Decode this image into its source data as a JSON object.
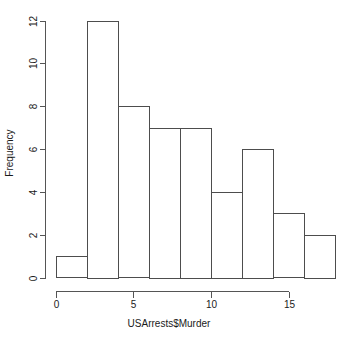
{
  "chart_data": {
    "type": "bar",
    "title": "",
    "subtitle": "",
    "xlabel": "USArrests$Murder",
    "ylabel": "Frequency",
    "categories": [
      "0-2",
      "2-4",
      "4-6",
      "6-8",
      "8-10",
      "10-12",
      "12-14",
      "14-16",
      "16-18"
    ],
    "bin_edges": [
      0,
      2,
      4,
      6,
      8,
      10,
      12,
      14,
      16,
      18
    ],
    "bin_width": 2,
    "values": [
      1,
      12,
      8,
      7,
      7,
      4,
      6,
      3,
      2
    ],
    "xlim": [
      0,
      18
    ],
    "ylim": [
      0,
      12
    ],
    "x_ticks": [
      0,
      5,
      10,
      15
    ],
    "x_tick_labels": [
      "0",
      "5",
      "10",
      "15"
    ],
    "y_ticks": [
      0,
      2,
      4,
      6,
      8,
      10,
      12
    ],
    "y_tick_labels": [
      "0",
      "2",
      "4",
      "6",
      "8",
      "10",
      "12"
    ],
    "grid": false,
    "legend": false,
    "legend_position": "none",
    "bar_fill_color": "#ffffff",
    "bar_border_color": "#4d4d4d",
    "axis_color": "#555555",
    "background_color": "#ffffff"
  }
}
